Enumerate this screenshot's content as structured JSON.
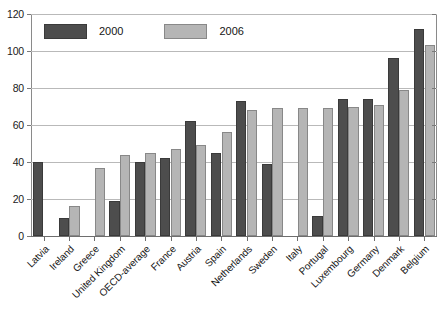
{
  "chart_data": {
    "type": "bar",
    "title": "",
    "subtitle": "",
    "xlabel": "",
    "ylabel": "",
    "ylim": [
      0,
      120
    ],
    "yticks": [
      0,
      20,
      40,
      60,
      80,
      100,
      120
    ],
    "grid": true,
    "legend_position": "top-left",
    "categories": [
      "Latvia",
      "Ireland",
      "Greece",
      "United Kingdom",
      "OECD-average",
      "France",
      "Austria",
      "Spain",
      "Netherlands",
      "Sweden",
      "Italy",
      "Portugal",
      "Luxembourg",
      "Germany",
      "Denmark",
      "Belgium"
    ],
    "series": [
      {
        "name": "2000",
        "color": "#4d4d4d",
        "values": [
          40,
          10,
          null,
          19,
          40,
          42,
          62,
          45,
          73,
          39,
          null,
          11,
          74,
          74,
          96,
          112
        ]
      },
      {
        "name": "2006",
        "color": "#b5b5b5",
        "values": [
          null,
          16,
          37,
          44,
          45,
          47,
          49,
          56,
          68,
          69,
          69,
          69,
          70,
          71,
          79,
          103
        ]
      }
    ]
  },
  "legend": {
    "items": [
      {
        "label": "2000",
        "swatch": "dark-gray-swatch"
      },
      {
        "label": "2006",
        "swatch": "light-gray-swatch"
      }
    ]
  },
  "axis": {
    "y_tick_labels": [
      "0",
      "20",
      "40",
      "60",
      "80",
      "100",
      "120"
    ]
  }
}
